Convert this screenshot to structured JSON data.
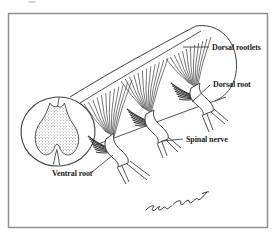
{
  "figure": {
    "labels": {
      "dorsal_rootlets": "Dorsal rootlets",
      "dorsal_root": "Dorsal root",
      "spinal_nerve": "Spinal nerve",
      "ventral_root": "Ventral root"
    },
    "signature_present": true,
    "colors": {
      "ink": "#3f3f3f",
      "text": "#1b1b1b",
      "background": "#ffffff",
      "border": "#8f8f8f"
    }
  }
}
